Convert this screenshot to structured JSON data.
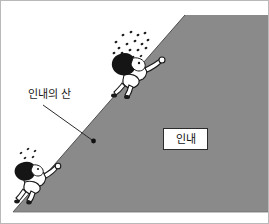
{
  "illustration": {
    "title": "Mountain of Patience cartoon illustration",
    "frame": {
      "border_color": "#b9b9b9",
      "background_color": "#ffffff"
    },
    "mountain": {
      "fill_color": "#8a8a8a",
      "edge_color": "#4a4a4a",
      "apex_label": "",
      "description": "steep gray triangular slope rising from lower-left to upper-right"
    },
    "labels": {
      "mountain_label": "인내의 산",
      "box_label": "인내"
    },
    "callout": {
      "line_color": "#2b2b2b",
      "dot_color": "#111111"
    },
    "climbers": [
      {
        "id": "upper-climber",
        "position": "upper slope",
        "has_sweat": true,
        "sweat_drop_count": 17
      },
      {
        "id": "lower-climber",
        "position": "lower slope",
        "has_sweat": true,
        "sweat_drop_count": 5
      }
    ],
    "colors": {
      "slope_gray": "#8a8a8a",
      "ink_black": "#1a1a1a",
      "paper_white": "#ffffff",
      "frame_gray": "#b9b9b9"
    }
  }
}
